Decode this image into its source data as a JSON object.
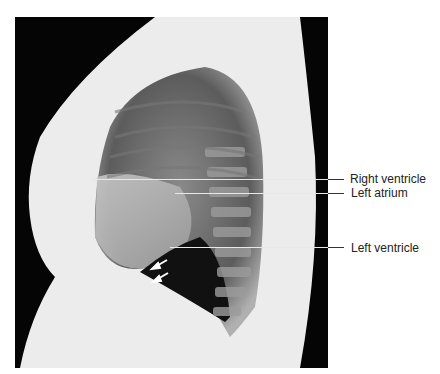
{
  "figure": {
    "labels": [
      {
        "text": "Right ventricle",
        "y": 179,
        "line_start_x": 93
      },
      {
        "text": "Left atrium",
        "y": 193,
        "line_start_x": 175
      },
      {
        "text": "Left ventricle",
        "y": 247,
        "line_start_x": 170
      }
    ],
    "arrows": {
      "count": 2,
      "color": "#ffffff",
      "direction": "down-left"
    }
  }
}
